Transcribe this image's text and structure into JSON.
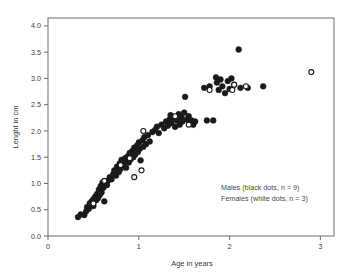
{
  "chart_data": {
    "type": "scatter",
    "title": "",
    "xlabel": "Age in years",
    "ylabel": "Lenght in cm",
    "xlim": [
      0,
      3.15
    ],
    "ylim": [
      0,
      4.15
    ],
    "xticks": [
      "0",
      "1",
      "2",
      "3"
    ],
    "xtick_values": [
      0,
      1,
      2,
      3
    ],
    "yticks": [
      "0.0",
      "0.5",
      "1.0",
      "1.5",
      "2.0",
      "2.5",
      "3.0",
      "3.5",
      "4.0"
    ],
    "ytick_values": [
      0.0,
      0.5,
      1.0,
      1.5,
      2.0,
      2.5,
      3.0,
      3.5,
      4.0
    ],
    "grid": false,
    "legend_position": "inside-lower-right",
    "legend": [
      "Males (black dots, n = 9)",
      "Females (white dots, n = 3)"
    ],
    "series": [
      {
        "name": "Males",
        "marker": "filled-circle",
        "color": "#1a1a1a",
        "points": [
          [
            0.33,
            0.36
          ],
          [
            0.36,
            0.41
          ],
          [
            0.4,
            0.4
          ],
          [
            0.42,
            0.47
          ],
          [
            0.43,
            0.55
          ],
          [
            0.45,
            0.52
          ],
          [
            0.46,
            0.62
          ],
          [
            0.47,
            0.58
          ],
          [
            0.48,
            0.66
          ],
          [
            0.49,
            0.61
          ],
          [
            0.5,
            0.7
          ],
          [
            0.5,
            0.57
          ],
          [
            0.52,
            0.75
          ],
          [
            0.53,
            0.68
          ],
          [
            0.54,
            0.8
          ],
          [
            0.55,
            0.72
          ],
          [
            0.56,
            0.88
          ],
          [
            0.57,
            0.78
          ],
          [
            0.58,
            0.95
          ],
          [
            0.59,
            0.83
          ],
          [
            0.6,
            1.02
          ],
          [
            0.61,
            0.92
          ],
          [
            0.62,
            0.66
          ],
          [
            0.63,
            1.0
          ],
          [
            0.65,
            0.97
          ],
          [
            0.66,
            1.05
          ],
          [
            0.68,
            1.12
          ],
          [
            0.7,
            1.08
          ],
          [
            0.72,
            1.18
          ],
          [
            0.73,
            1.25
          ],
          [
            0.75,
            1.15
          ],
          [
            0.76,
            1.32
          ],
          [
            0.78,
            1.22
          ],
          [
            0.79,
            1.38
          ],
          [
            0.8,
            1.28
          ],
          [
            0.81,
            1.45
          ],
          [
            0.83,
            1.35
          ],
          [
            0.84,
            1.42
          ],
          [
            0.85,
            1.48
          ],
          [
            0.86,
            1.3
          ],
          [
            0.88,
            1.52
          ],
          [
            0.89,
            1.4
          ],
          [
            0.9,
            1.58
          ],
          [
            0.91,
            1.46
          ],
          [
            0.93,
            1.62
          ],
          [
            0.94,
            1.5
          ],
          [
            0.95,
            1.68
          ],
          [
            0.96,
            1.55
          ],
          [
            0.98,
            1.72
          ],
          [
            0.99,
            1.6
          ],
          [
            1.0,
            1.78
          ],
          [
            1.01,
            1.66
          ],
          [
            1.02,
            1.44
          ],
          [
            1.04,
            1.82
          ],
          [
            1.05,
            1.7
          ],
          [
            1.06,
            1.88
          ],
          [
            1.08,
            1.75
          ],
          [
            1.1,
            1.92
          ],
          [
            1.12,
            1.8
          ],
          [
            1.15,
            1.98
          ],
          [
            1.18,
            2.02
          ],
          [
            1.2,
            2.08
          ],
          [
            1.22,
            1.96
          ],
          [
            1.25,
            2.12
          ],
          [
            1.28,
            2.05
          ],
          [
            1.3,
            2.18
          ],
          [
            1.32,
            2.1
          ],
          [
            1.34,
            2.22
          ],
          [
            1.35,
            2.3
          ],
          [
            1.36,
            2.15
          ],
          [
            1.38,
            2.25
          ],
          [
            1.4,
            2.08
          ],
          [
            1.42,
            2.2
          ],
          [
            1.44,
            2.32
          ],
          [
            1.45,
            2.12
          ],
          [
            1.47,
            2.26
          ],
          [
            1.48,
            2.18
          ],
          [
            1.5,
            2.35
          ],
          [
            1.51,
            2.65
          ],
          [
            1.53,
            2.22
          ],
          [
            1.55,
            2.28
          ],
          [
            1.57,
            2.15
          ],
          [
            1.58,
            2.2
          ],
          [
            1.6,
            2.12
          ],
          [
            1.62,
            2.18
          ],
          [
            1.72,
            2.82
          ],
          [
            1.75,
            2.2
          ],
          [
            1.78,
            2.85
          ],
          [
            1.82,
            2.2
          ],
          [
            1.85,
            3.02
          ],
          [
            1.86,
            2.92
          ],
          [
            1.88,
            2.78
          ],
          [
            1.9,
            2.98
          ],
          [
            1.92,
            2.85
          ],
          [
            1.95,
            2.72
          ],
          [
            1.98,
            2.95
          ],
          [
            2.0,
            2.8
          ],
          [
            2.02,
            3.0
          ],
          [
            2.05,
            2.88
          ],
          [
            2.1,
            3.55
          ],
          [
            2.12,
            2.82
          ],
          [
            2.2,
            2.82
          ],
          [
            2.37,
            2.85
          ]
        ]
      },
      {
        "name": "Females",
        "marker": "open-circle",
        "color": "#ffffff",
        "points": [
          [
            0.5,
            0.62
          ],
          [
            0.62,
            1.05
          ],
          [
            0.8,
            1.35
          ],
          [
            0.9,
            1.48
          ],
          [
            0.95,
            1.12
          ],
          [
            1.03,
            1.25
          ],
          [
            1.05,
            2.0
          ],
          [
            1.4,
            2.28
          ],
          [
            1.55,
            2.12
          ],
          [
            1.78,
            2.78
          ],
          [
            2.05,
            2.88
          ],
          [
            2.03,
            2.78
          ],
          [
            2.18,
            2.85
          ],
          [
            2.9,
            3.12
          ]
        ]
      }
    ]
  }
}
